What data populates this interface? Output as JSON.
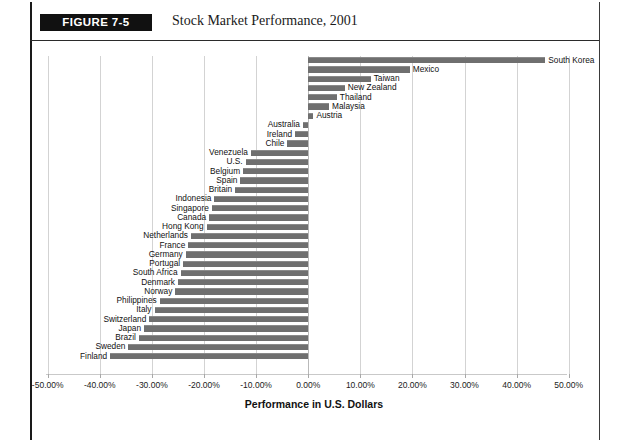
{
  "figure": {
    "tag": "FIGURE 7-5",
    "title": "Stock Market Performance, 2001"
  },
  "axis": {
    "x_title": "Performance in U.S. Dollars",
    "tick_labels": [
      "-50.00%",
      "-40.00%",
      "-30.00%",
      "-20.00%",
      "-10.00%",
      "0.00%",
      "10.00%",
      "20.00%",
      "30.00%",
      "40.00%",
      "50.00%"
    ]
  },
  "colors": {
    "bar": "#6f6f6f",
    "tag_background": "#111111",
    "tag_text": "#ffffff",
    "gridline": "#d3d3d3",
    "frame": "#1a1a1a"
  },
  "chart_data": {
    "type": "bar",
    "orientation": "horizontal",
    "title": "Stock Market Performance, 2001",
    "xlabel": "Performance in U.S. Dollars",
    "ylabel": "",
    "xlim": [
      -50,
      50
    ],
    "xticks": [
      -50,
      -40,
      -30,
      -20,
      -10,
      0,
      10,
      20,
      30,
      40,
      50
    ],
    "xtick_labels": [
      "-50.00%",
      "-40.00%",
      "-30.00%",
      "-20.00%",
      "-10.00%",
      "0.00%",
      "10.00%",
      "20.00%",
      "30.00%",
      "40.00%",
      "50.00%"
    ],
    "grid": true,
    "legend": false,
    "categories": [
      "South Korea",
      "Mexico",
      "Taiwan",
      "New Zealand",
      "Thailand",
      "Malaysia",
      "Austria",
      "Australia",
      "Ireland",
      "Chile",
      "Venezuela",
      "U.S.",
      "Belgium",
      "Spain",
      "Britain",
      "Indonesia",
      "Singapore",
      "Canada",
      "Hong Kong",
      "Netherlands",
      "France",
      "Germany",
      "Portugal",
      "South Africa",
      "Denmark",
      "Norway",
      "Philippines",
      "Italy",
      "Switzerland",
      "Japan",
      "Brazil",
      "Sweden",
      "Finland"
    ],
    "values": [
      45.5,
      19.5,
      12.0,
      7.0,
      5.5,
      4.0,
      1.0,
      -1.0,
      -2.5,
      -4.0,
      -11.0,
      -12.0,
      -12.5,
      -13.0,
      -14.0,
      -18.0,
      -18.5,
      -19.0,
      -19.5,
      -22.5,
      -23.0,
      -23.5,
      -24.0,
      -24.5,
      -25.0,
      -25.5,
      -28.5,
      -29.5,
      -30.5,
      -31.5,
      -32.5,
      -34.5,
      -38.0
    ]
  }
}
